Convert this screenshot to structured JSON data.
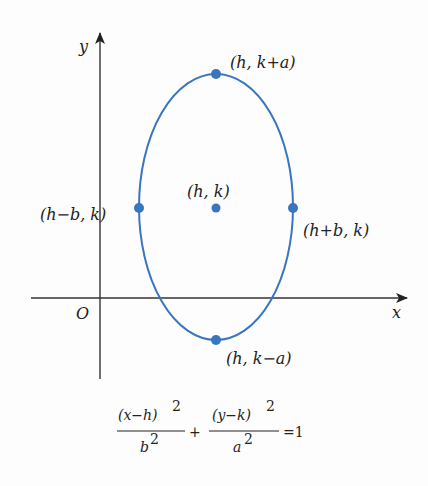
{
  "colors": {
    "curve": "#3a75bf",
    "axis": "#333333",
    "text": "#222222"
  },
  "axes": {
    "x_label": "x",
    "y_label": "y",
    "origin_label": "O"
  },
  "ellipse": {
    "center": {
      "h": 0,
      "k": 0
    },
    "semi_minor_b": 1,
    "semi_major_a": 1.74,
    "orientation": "vertical"
  },
  "points": [
    {
      "name": "top-vertex",
      "label": "(h, k+a)"
    },
    {
      "name": "center",
      "label": "(h, k)"
    },
    {
      "name": "left-covertex",
      "label": "(h−b, k)"
    },
    {
      "name": "right-covertex",
      "label": "(h+b, k)"
    },
    {
      "name": "bottom-vertex",
      "label": "(h, k−a)"
    }
  ],
  "equation": {
    "num1": "(x−h)",
    "den1": "b",
    "num2": "(y−k)",
    "den2": "a",
    "exp": "2",
    "plus": "+",
    "rhs": "=1"
  }
}
